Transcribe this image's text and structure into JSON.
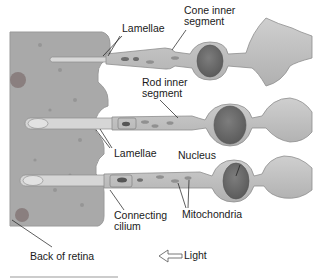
{
  "diagram": {
    "colors": {
      "retina_back": "#a8a8a8",
      "cell_body": "#bdbdbd",
      "cell_outline": "#8e8e8e",
      "nucleus": "#6e6e6e",
      "mitochondria": "#8a8a8a",
      "label_text": "#1a1a1a",
      "leader_line": "#1a1a1a"
    },
    "labels": {
      "lamellae_top": "Lamellae",
      "cone_inner_segment_line1": "Cone inner",
      "cone_inner_segment_line2": "segment",
      "rod_inner_segment_line1": "Rod inner",
      "rod_inner_segment_line2": "segment",
      "lamellae_middle": "Lamellae",
      "nucleus": "Nucleus",
      "connecting_cilium_line1": "Connecting",
      "connecting_cilium_line2": "cilium",
      "mitochondria": "Mitochondria",
      "back_of_retina": "Back of retina",
      "light": "Light"
    },
    "cells": [
      {
        "type": "cone",
        "row": 1
      },
      {
        "type": "rod",
        "row": 2
      },
      {
        "type": "rod",
        "row": 3
      }
    ],
    "light_direction": "right-to-left"
  }
}
